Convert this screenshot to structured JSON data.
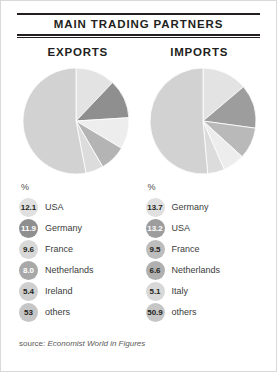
{
  "panel": {
    "title": "MAIN TRADING PARTNERS",
    "source_prefix": "source: ",
    "source_italic": "Economist World in Figures"
  },
  "columns": [
    {
      "heading": "EXPORTS"
    },
    {
      "heading": "IMPORTS"
    }
  ],
  "legend_header": "%",
  "colors": {
    "slice_light": "#d5d5d5",
    "slice_lighter": "#e8e8e8",
    "slice_mid": "#b9b9b9",
    "slice_dark": "#8f8f8f",
    "slice_others": "#d0d0d0",
    "text": "#231f20",
    "rule": "#231f20"
  },
  "chart_data": [
    {
      "type": "pie",
      "title": "EXPORTS",
      "unit": "%",
      "start_angle": 0,
      "direction": "clockwise",
      "categories": [
        "USA",
        "Germany",
        "France",
        "Netherlands",
        "Ireland",
        "others"
      ],
      "values": [
        12.1,
        11.9,
        9.6,
        8.0,
        5.4,
        53
      ],
      "labels": [
        "12.1",
        "11.9",
        "9.6",
        "8.0",
        "5.4",
        "53"
      ],
      "slice_colors": [
        "#e3e3e3",
        "#8f8f8f",
        "#ededed",
        "#b4b4b4",
        "#dcdcdc",
        "#d2d2d2"
      ],
      "swatch_colors": [
        "#e0e0e0",
        "#8f8f8f",
        "#d8d8d8",
        "#a8a8a8",
        "#cfcfcf",
        "#c6c6c6"
      ],
      "swatch_dark": [
        false,
        true,
        false,
        true,
        false,
        false
      ]
    },
    {
      "type": "pie",
      "title": "IMPORTS",
      "unit": "%",
      "start_angle": 0,
      "direction": "clockwise",
      "categories": [
        "Germany",
        "USA",
        "France",
        "Netherlands",
        "Italy",
        "others"
      ],
      "values": [
        13.7,
        13.2,
        9.5,
        6.6,
        5.1,
        50.9
      ],
      "labels": [
        "13.7",
        "13.2",
        "9.5",
        "6.6",
        "5.1",
        "50.9"
      ],
      "slice_colors": [
        "#e3e3e3",
        "#9d9d9d",
        "#b9b9b9",
        "#ededed",
        "#dcdcdc",
        "#d2d2d2"
      ],
      "swatch_colors": [
        "#e0e0e0",
        "#9d9d9d",
        "#bdbdbd",
        "#b0b0b0",
        "#d8d8d8",
        "#c6c6c6"
      ],
      "swatch_dark": [
        false,
        true,
        false,
        false,
        false,
        false
      ]
    }
  ]
}
